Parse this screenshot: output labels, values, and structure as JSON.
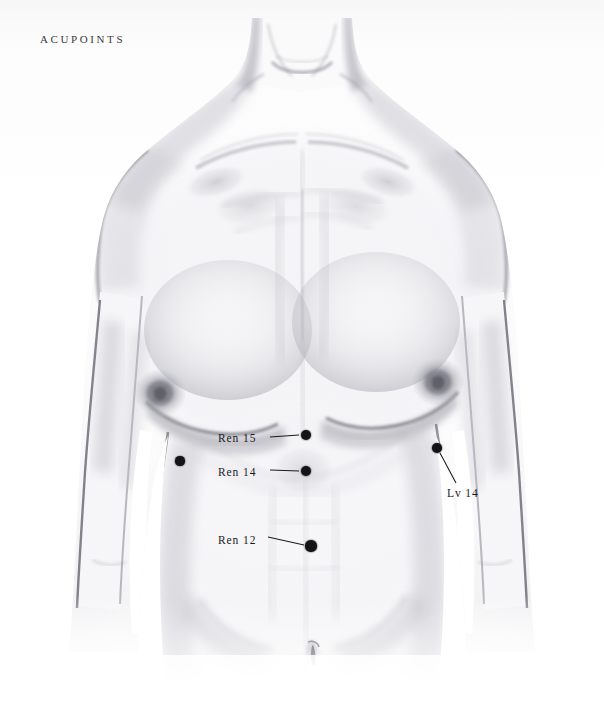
{
  "page": {
    "title": "Acupoints",
    "background_color": "#fdfdfd",
    "width": 604,
    "height": 727
  },
  "header": {
    "title": "Acupoints"
  },
  "illustration": {
    "subject": "male-torso-anterior-pencil-drawing",
    "medium": "graphite pencil drawing",
    "view": "anterior (front) view of male torso from neck to lower abdomen",
    "ink_color": "#3c3c42",
    "marker_color": "#141416"
  },
  "acupoints": [
    {
      "id": "ren15",
      "label": "Ren 15",
      "label_x": 218,
      "label_y": 433,
      "dot_x": 306,
      "dot_y": 435,
      "dot_r": 5.2,
      "leader": {
        "x1": 270,
        "y1": 437,
        "x2": 299,
        "y2": 435
      },
      "labeled": true
    },
    {
      "id": "ren14",
      "label": "Ren 14",
      "label_x": 218,
      "label_y": 467,
      "dot_x": 306,
      "dot_y": 471,
      "dot_r": 5.0,
      "leader": {
        "x1": 270,
        "y1": 470,
        "x2": 299,
        "y2": 471
      },
      "labeled": true
    },
    {
      "id": "ren12",
      "label": "Ren 12",
      "label_x": 218,
      "label_y": 535,
      "dot_x": 311,
      "dot_y": 546,
      "dot_r": 5.6,
      "leader": {
        "x1": 268,
        "y1": 537,
        "x2": 304,
        "y2": 545
      },
      "labeled": true
    },
    {
      "id": "lv14-right",
      "label": "Lv 14",
      "label_x": 447,
      "label_y": 488,
      "dot_x": 437,
      "dot_y": 448,
      "dot_r": 4.8,
      "leader": {
        "x1": 440,
        "y1": 453,
        "x2": 456,
        "y2": 483
      },
      "labeled": true
    },
    {
      "id": "lv14-left",
      "label": "",
      "dot_x": 180,
      "dot_y": 461,
      "dot_r": 4.6,
      "labeled": false
    }
  ],
  "colors": {
    "paper": "#fdfdfd",
    "graphite_dark": "#55555c",
    "graphite_mid": "#8d8d95",
    "graphite_light": "#c9c9cf",
    "label_text": "#1b1b1e",
    "title_text": "#3a3a3e",
    "dot": "#141416"
  }
}
